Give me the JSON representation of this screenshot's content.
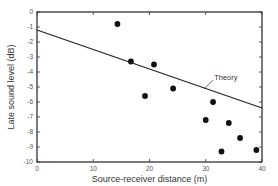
{
  "chart_data": {
    "type": "scatter",
    "title": "",
    "xlabel": "Source-receiver distance (m)",
    "ylabel": "Late sound level (dB)",
    "xlim": [
      0,
      40
    ],
    "ylim": [
      -10,
      0
    ],
    "xticks": [
      0,
      10,
      20,
      30,
      40
    ],
    "yticks": [
      0,
      -1,
      -2,
      -3,
      -4,
      -5,
      -6,
      -7,
      -8,
      -9,
      -10
    ],
    "grid": false,
    "legend": null,
    "series": [
      {
        "name": "Measured",
        "type": "scatter",
        "color": "#111111",
        "points": [
          {
            "x": 14.3,
            "y": -0.8
          },
          {
            "x": 16.7,
            "y": -3.3
          },
          {
            "x": 19.2,
            "y": -5.6
          },
          {
            "x": 20.8,
            "y": -3.5
          },
          {
            "x": 24.2,
            "y": -5.1
          },
          {
            "x": 30.0,
            "y": -7.2
          },
          {
            "x": 31.3,
            "y": -6.0
          },
          {
            "x": 32.8,
            "y": -9.3
          },
          {
            "x": 34.1,
            "y": -7.4
          },
          {
            "x": 36.1,
            "y": -8.4
          },
          {
            "x": 39.0,
            "y": -9.2
          }
        ]
      },
      {
        "name": "Theory",
        "type": "line",
        "color": "#222222",
        "points": [
          {
            "x": 0,
            "y": -1.2
          },
          {
            "x": 40,
            "y": -6.4
          }
        ]
      }
    ],
    "annotations": [
      {
        "text": "Theory",
        "x": 31.5,
        "y": -4.4
      }
    ]
  }
}
